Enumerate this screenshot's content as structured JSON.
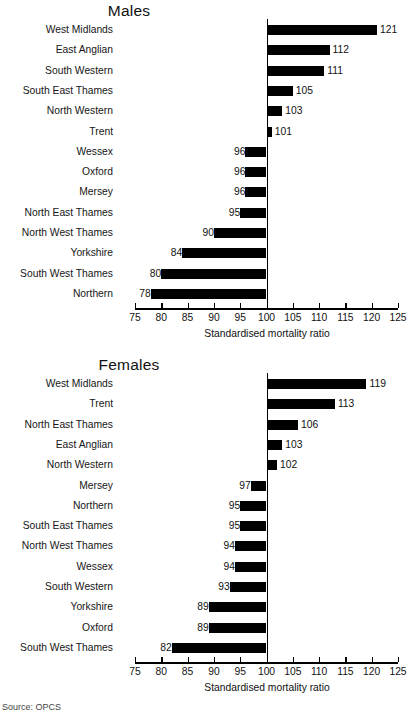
{
  "figure": {
    "width": 406,
    "height": 708,
    "footer_note": "Source: OPCS"
  },
  "chart_data": [
    {
      "type": "bar",
      "orientation": "horizontal",
      "title": "Males",
      "xlabel": "Standardised mortality ratio",
      "ylabel": "",
      "xlim": [
        75,
        125
      ],
      "baseline": 100,
      "xticks": [
        75,
        80,
        85,
        90,
        95,
        100,
        105,
        110,
        115,
        120,
        125
      ],
      "grid": false,
      "legend": "none",
      "bar_color": "#000000",
      "categories": [
        "West Midlands",
        "East Anglian",
        "South Western",
        "South East Thames",
        "North Western",
        "Trent",
        "Wessex",
        "Oxford",
        "Mersey",
        "North East Thames",
        "North West Thames",
        "Yorkshire",
        "South West Thames",
        "Northern"
      ],
      "values": [
        121,
        112,
        111,
        105,
        103,
        101,
        96,
        96,
        96,
        95,
        90,
        84,
        80,
        78
      ]
    },
    {
      "type": "bar",
      "orientation": "horizontal",
      "title": "Females",
      "xlabel": "Standardised mortality ratio",
      "ylabel": "",
      "xlim": [
        75,
        125
      ],
      "baseline": 100,
      "xticks": [
        75,
        80,
        85,
        90,
        95,
        100,
        105,
        110,
        115,
        120,
        125
      ],
      "grid": false,
      "legend": "none",
      "bar_color": "#000000",
      "categories": [
        "West Midlands",
        "Trent",
        "North East Thames",
        "East Anglian",
        "North Western",
        "Mersey",
        "Northern",
        "South East Thames",
        "North West Thames",
        "Wessex",
        "South Western",
        "Yorkshire",
        "Oxford",
        "South West Thames"
      ],
      "values": [
        119,
        113,
        106,
        103,
        102,
        97,
        95,
        95,
        94,
        94,
        93,
        89,
        89,
        82
      ]
    }
  ]
}
